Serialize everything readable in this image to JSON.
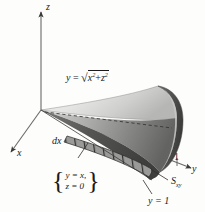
{
  "figure": {
    "background_color": "#fdfdfc",
    "ink_color": "#1a1a1a"
  },
  "axes": {
    "z_label": "z",
    "x_label": "x",
    "y_label": "y",
    "tick_label_one": "1"
  },
  "labels": {
    "surface_equation": {
      "lhs": "y",
      "equals": "=",
      "radical_sign": "√",
      "radicand_first_base": "x",
      "radicand_first_exp": "2",
      "plus": "+",
      "radicand_second_base": "z",
      "radicand_second_exp": "2"
    },
    "differential": "dx",
    "system": {
      "open_brace": "{",
      "close_brace": "}",
      "row_one": "y = x,",
      "row_two": "z = 0"
    },
    "cross_section": {
      "base": "S",
      "subscript": "xy"
    },
    "plane": "y = 1"
  },
  "colors": {
    "cone_top_light": "#e9e9e7",
    "cone_top_mid": "#cfcfcd",
    "cone_front_light": "#bdbdbb",
    "cone_front_dark": "#6d6d6b",
    "cone_bottom_dark": "#4a4a49",
    "disc_light": "#d8d8d6",
    "disc_dark": "#5c5c5a",
    "strip_fill": "#8f8f8d",
    "axis_line": "#555555",
    "dashed_line": "#3a3a3a"
  }
}
